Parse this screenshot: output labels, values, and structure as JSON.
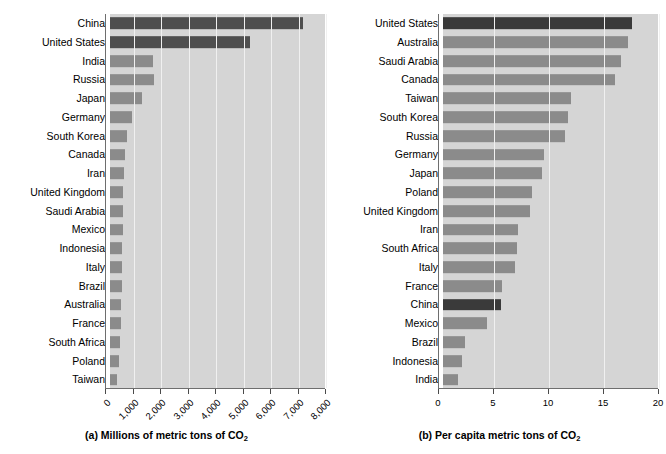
{
  "figure": {
    "panels": [
      {
        "id": "panel-a",
        "caption_prefix": "(a) Millions of metric tons of CO",
        "caption_sub": "2"
      },
      {
        "id": "panel-b",
        "caption_prefix": "(b) Per capita metric tons of CO",
        "caption_sub": "2"
      }
    ]
  },
  "chart_data": [
    {
      "type": "bar",
      "orientation": "horizontal",
      "title": "(a) Millions of metric tons of CO2",
      "xlabel": "Millions of metric tons of CO2",
      "ylabel": "",
      "xlim": [
        0,
        8000
      ],
      "grid": true,
      "legend": "none",
      "highlight_color": "#4e4e4e",
      "bar_color": "#8b8b8b",
      "plot_background": "#d5d5d5",
      "tick_labels": [
        "0",
        "1,000",
        "2,000",
        "3,000",
        "4,000",
        "5,000",
        "6,000",
        "7,000",
        "8,000"
      ],
      "tick_values": [
        0,
        1000,
        2000,
        3000,
        4000,
        5000,
        6000,
        7000,
        8000
      ],
      "categories": [
        "China",
        "United States",
        "India",
        "Russia",
        "Japan",
        "Germany",
        "South Korea",
        "Canada",
        "Iran",
        "United Kingdom",
        "Saudi Arabia",
        "Mexico",
        "Indonesia",
        "Italy",
        "Brazil",
        "Australia",
        "France",
        "South Africa",
        "Poland",
        "Taiwan"
      ],
      "values": [
        7000,
        5100,
        1550,
        1600,
        1150,
        800,
        600,
        550,
        500,
        490,
        470,
        460,
        450,
        430,
        420,
        400,
        390,
        380,
        330,
        270
      ],
      "highlighted": [
        "China",
        "United States"
      ]
    },
    {
      "type": "bar",
      "orientation": "horizontal",
      "title": "(b) Per capita metric tons of CO2",
      "xlabel": "Per capita metric tons of CO2",
      "ylabel": "",
      "xlim": [
        0,
        20
      ],
      "grid": true,
      "legend": "none",
      "highlight_color": "#3a3a3a",
      "bar_color": "#8b8b8b",
      "plot_background": "#d5d5d5",
      "tick_labels": [
        "0",
        "5",
        "10",
        "15",
        "20"
      ],
      "tick_values": [
        0,
        5,
        10,
        15,
        20
      ],
      "categories": [
        "United States",
        "Australia",
        "Saudi Arabia",
        "Canada",
        "Taiwan",
        "South Korea",
        "Russia",
        "Germany",
        "Japan",
        "Poland",
        "United Kingdom",
        "Iran",
        "South Africa",
        "Italy",
        "France",
        "China",
        "Mexico",
        "Brazil",
        "Indonesia",
        "India"
      ],
      "values": [
        17.2,
        16.8,
        16.2,
        15.6,
        11.6,
        11.4,
        11.1,
        9.2,
        9.0,
        8.1,
        7.9,
        6.8,
        6.7,
        6.5,
        5.4,
        5.3,
        4.0,
        2.0,
        1.7,
        1.4
      ],
      "highlighted": [
        "China",
        "United States"
      ]
    }
  ]
}
